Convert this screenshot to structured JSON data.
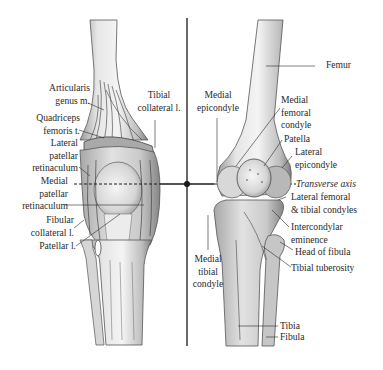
{
  "figure": {
    "colors": {
      "ink": "#2a2a2a",
      "bone_light": "#e8e8e8",
      "bone_mid": "#c4c4c4",
      "bone_dark": "#8a8a8a",
      "axis": "#1a1a1a"
    }
  },
  "left_panel": {
    "view": "soft-tissue",
    "labels": [
      {
        "id": "articularis",
        "text_lines": [
          "Articularis",
          "genus m."
        ]
      },
      {
        "id": "tibial_collateral",
        "text_lines": [
          "Tibial",
          "collateral l."
        ]
      },
      {
        "id": "quadriceps",
        "text_lines": [
          "Quadriceps",
          "femoris t."
        ]
      },
      {
        "id": "lateral_patellar_ret",
        "text_lines": [
          "Lateral",
          "patellar",
          "retinaculum"
        ]
      },
      {
        "id": "medial_patellar_ret",
        "text_lines": [
          "Medial",
          "patellar",
          "retinaculum"
        ]
      },
      {
        "id": "fibular_collateral",
        "text_lines": [
          "Fibular",
          "collateral l."
        ]
      },
      {
        "id": "patellar_l",
        "text_lines": [
          "Patellar l."
        ]
      }
    ]
  },
  "right_panel": {
    "view": "skeletal",
    "labels": [
      {
        "id": "femur",
        "text_lines": [
          "Femur"
        ]
      },
      {
        "id": "medial_epicondyle",
        "text_lines": [
          "Medial",
          "epicondyle"
        ]
      },
      {
        "id": "medial_femoral_condyle",
        "text_lines": [
          "Medial",
          "femoral",
          "condyle"
        ]
      },
      {
        "id": "patella",
        "text_lines": [
          "Patella"
        ]
      },
      {
        "id": "lateral_epicondyle",
        "text_lines": [
          "Lateral",
          "epicondyle"
        ]
      },
      {
        "id": "transverse_axis",
        "text_lines": [
          "Transverse axis"
        ]
      },
      {
        "id": "lateral_condyles",
        "text_lines": [
          "Lateral femoral",
          "& tibial condyles"
        ]
      },
      {
        "id": "intercondylar",
        "text_lines": [
          "Intercondylar",
          "eminence"
        ]
      },
      {
        "id": "head_fibula",
        "text_lines": [
          "Head of fibula"
        ]
      },
      {
        "id": "tibial_tuberosity",
        "text_lines": [
          "Tibial tuberosity"
        ]
      },
      {
        "id": "medial_tibial_condyle",
        "text_lines": [
          "Medial",
          "tibial",
          "condyle"
        ]
      },
      {
        "id": "tibia",
        "text_lines": [
          "Tibia"
        ]
      },
      {
        "id": "fibula",
        "text_lines": [
          "Fibula"
        ]
      }
    ]
  }
}
